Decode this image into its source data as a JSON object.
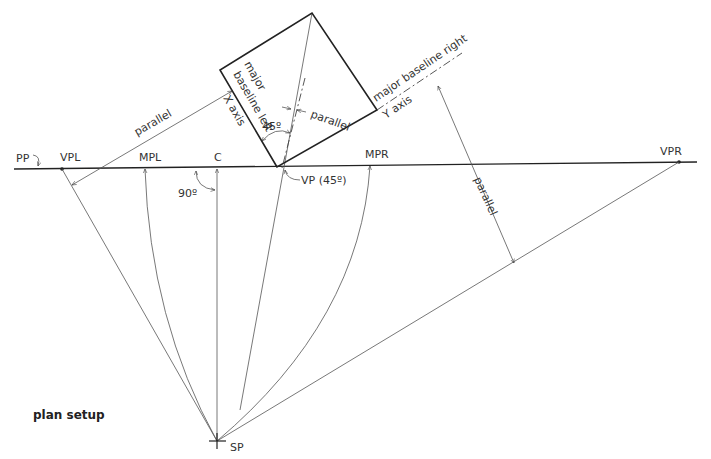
{
  "diagram": {
    "title": "plan setup",
    "picture_plane": {
      "label": "PP"
    },
    "points": {
      "vpl": "VPL",
      "mpl": "MPL",
      "c": "C",
      "vp45": "VP (45º)",
      "mpr": "MPR",
      "vpr": "VPR",
      "sp": "SP"
    },
    "square_labels": {
      "major": "major",
      "baseline_left": "baseline left",
      "x_axis": "X axis",
      "angle_45": "45º",
      "parallel_inner": "parallel",
      "baseline_right": "major baseline right",
      "y_axis": "Y axis"
    },
    "parallel_left": "parallel",
    "parallel_right": "parallel",
    "angle_90": "90º"
  }
}
